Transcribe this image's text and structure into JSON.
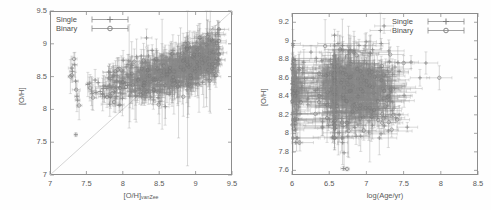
{
  "figure": {
    "background": "#fefefe",
    "data_color": "#8a8a8a",
    "frame_color": "#8d8d8d",
    "text_color": "#5a5a5a"
  },
  "panels": [
    {
      "id": "left",
      "name": "oh-vs-ohvanzee-plot",
      "frame": {
        "x": 50,
        "y": 11,
        "w": 182,
        "h": 164
      },
      "x_axis": {
        "label_main": "[O/H]",
        "label_sub": "vanZee",
        "min": 7,
        "max": 9.5,
        "ticks": [
          "7",
          "7.5",
          "8",
          "8.5",
          "9",
          "9.5"
        ],
        "tick_values": [
          7,
          7.5,
          8,
          8.5,
          9,
          9.5
        ]
      },
      "y_axis": {
        "label": "[O/H]",
        "min": 7,
        "max": 9.5,
        "ticks": [
          "7",
          "7.5",
          "8",
          "8.5",
          "9",
          "9.5"
        ],
        "tick_values": [
          7,
          7.5,
          8,
          8.5,
          9,
          9.5
        ]
      },
      "legend": {
        "position": "top-left",
        "entries": [
          {
            "label": "Single",
            "marker": "cross-errorbar"
          },
          {
            "label": "Binary",
            "marker": "circle-errorbar"
          }
        ]
      },
      "has_identity_line": true
    },
    {
      "id": "right",
      "name": "oh-vs-logage-plot",
      "frame": {
        "x": 292,
        "y": 13,
        "w": 186,
        "h": 162
      },
      "x_axis": {
        "label_main": "log(Age/yr)",
        "label_sub": "",
        "min": 6,
        "max": 8.5,
        "ticks": [
          "6",
          "6.5",
          "7",
          "7.5",
          "8",
          "8.5"
        ],
        "tick_values": [
          6,
          6.5,
          7,
          7.5,
          8,
          8.5
        ]
      },
      "y_axis": {
        "label": "[O/H]",
        "min": 7.55,
        "max": 9.3,
        "ticks": [
          "7.6",
          "7.8",
          "8",
          "8.2",
          "8.4",
          "8.6",
          "8.8",
          "9",
          "9.2"
        ],
        "tick_values": [
          7.6,
          7.8,
          8,
          8.2,
          8.4,
          8.6,
          8.8,
          9,
          9.2
        ]
      },
      "legend": {
        "position": "top-right",
        "entries": [
          {
            "label": "Single",
            "marker": "cross-errorbar"
          },
          {
            "label": "Binary",
            "marker": "circle-errorbar"
          }
        ]
      },
      "has_identity_line": false
    }
  ],
  "chart_data": [
    {
      "type": "scatter",
      "panel": "left",
      "title": "",
      "xlabel": "[O/H]_vanZee",
      "ylabel": "[O/H]",
      "xlim": [
        7,
        9.5
      ],
      "ylim": [
        7,
        9.5
      ],
      "grid": false,
      "legend_position": "top-left",
      "reference_line": {
        "type": "identity",
        "from": [
          7,
          7
        ],
        "to": [
          9.5,
          9.5
        ]
      },
      "series": [
        {
          "name": "Single",
          "marker": "cross",
          "n_points": 620,
          "x_range": [
            7.25,
            9.3
          ],
          "y_range": [
            7.6,
            9.2
          ],
          "x_mode": 8.6,
          "y_mode": 8.5,
          "trend": "rising positive correlation toward upper right",
          "typical_xerr": 0.06,
          "typical_yerr": 0.12
        },
        {
          "name": "Binary",
          "marker": "circle",
          "n_points": 140,
          "x_range": [
            7.3,
            9.25
          ],
          "y_range": [
            7.8,
            9.1
          ],
          "x_mode": 8.5,
          "y_mode": 8.5,
          "trend": "overlaps single population",
          "typical_xerr": 0.07,
          "typical_yerr": 0.16
        }
      ],
      "outlier_cluster": {
        "description": "isolated points at low x (7.25-7.6) with high y (7.6-8.8)",
        "x_range": [
          7.25,
          7.6
        ],
        "y_range": [
          7.6,
          8.8
        ]
      }
    },
    {
      "type": "scatter",
      "panel": "right",
      "title": "",
      "xlabel": "log(Age/yr)",
      "ylabel": "[O/H]",
      "xlim": [
        6,
        8.5
      ],
      "ylim": [
        7.55,
        9.3
      ],
      "grid": false,
      "legend_position": "top-right",
      "series": [
        {
          "name": "Single",
          "marker": "cross",
          "n_points": 600,
          "x_range": [
            6.0,
            7.6
          ],
          "y_range": [
            7.95,
            9.15
          ],
          "x_mode": 6.85,
          "y_mode": 8.5,
          "trend": "no strong correlation; dense cluster 6.5-7.2",
          "typical_xerr": 0.14,
          "typical_yerr": 0.1
        },
        {
          "name": "Binary",
          "marker": "circle",
          "n_points": 130,
          "x_range": [
            6.0,
            8.05
          ],
          "y_range": [
            7.9,
            9.1
          ],
          "x_mode": 6.9,
          "y_mode": 8.5,
          "trend": "scattered, extends to higher ages",
          "typical_xerr": 0.18,
          "typical_yerr": 0.13
        }
      ],
      "vertical_feature": {
        "x": 6.57,
        "description": "near-vertical pileup of points"
      },
      "outlier_cluster": {
        "description": "low metallicity points near y=7.6-7.9 around x=6.65-6.75",
        "x_range": [
          6.6,
          6.8
        ],
        "y_range": [
          7.6,
          7.95
        ]
      }
    }
  ]
}
